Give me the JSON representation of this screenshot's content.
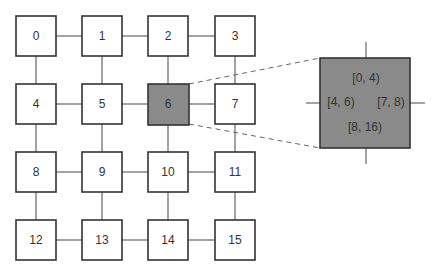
{
  "diagram": {
    "type": "4x4 mesh grid",
    "nodes": [
      "0",
      "1",
      "2",
      "3",
      "4",
      "5",
      "6",
      "7",
      "8",
      "9",
      "10",
      "11",
      "12",
      "13",
      "14",
      "15"
    ],
    "highlighted_node": "6",
    "highlight_color": "#8a8a8a",
    "zoom_panel": {
      "top": "[0, 4)",
      "left": "[4, 6)",
      "right": "[7, 8)",
      "bottom": "[8, 16)"
    }
  }
}
